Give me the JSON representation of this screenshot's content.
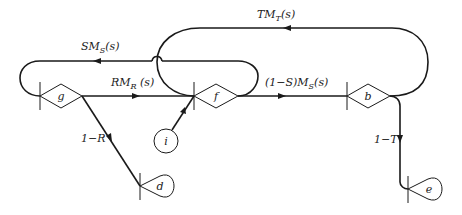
{
  "diagram": {
    "type": "signal-flow-graph",
    "nodes": {
      "g": {
        "label": "g",
        "shape": "diamond"
      },
      "f": {
        "label": "f",
        "shape": "diamond"
      },
      "b": {
        "label": "b",
        "shape": "diamond"
      },
      "i": {
        "label": "i",
        "shape": "circle"
      },
      "d": {
        "label": "d",
        "shape": "teardrop"
      },
      "e": {
        "label": "e",
        "shape": "teardrop"
      }
    },
    "edges": [
      {
        "from": "g",
        "to": "f",
        "label_main": "RM",
        "label_sub": "R",
        "label_tail": " (s)"
      },
      {
        "from": "f",
        "to": "b",
        "label_main": "(1−S)M",
        "label_sub": "S",
        "label_tail": "(s)"
      },
      {
        "from": "f",
        "to": "g",
        "label_main": "SM",
        "label_sub": "S",
        "label_tail": "(s)"
      },
      {
        "from": "b",
        "to": "f",
        "label_main": "TM",
        "label_sub": "T",
        "label_tail": "(s)"
      },
      {
        "from": "g",
        "to": "d",
        "label_main": "1−R"
      },
      {
        "from": "b",
        "to": "e",
        "label_main": "1−T"
      },
      {
        "from": "i",
        "to": "f",
        "label_main": ""
      }
    ]
  }
}
